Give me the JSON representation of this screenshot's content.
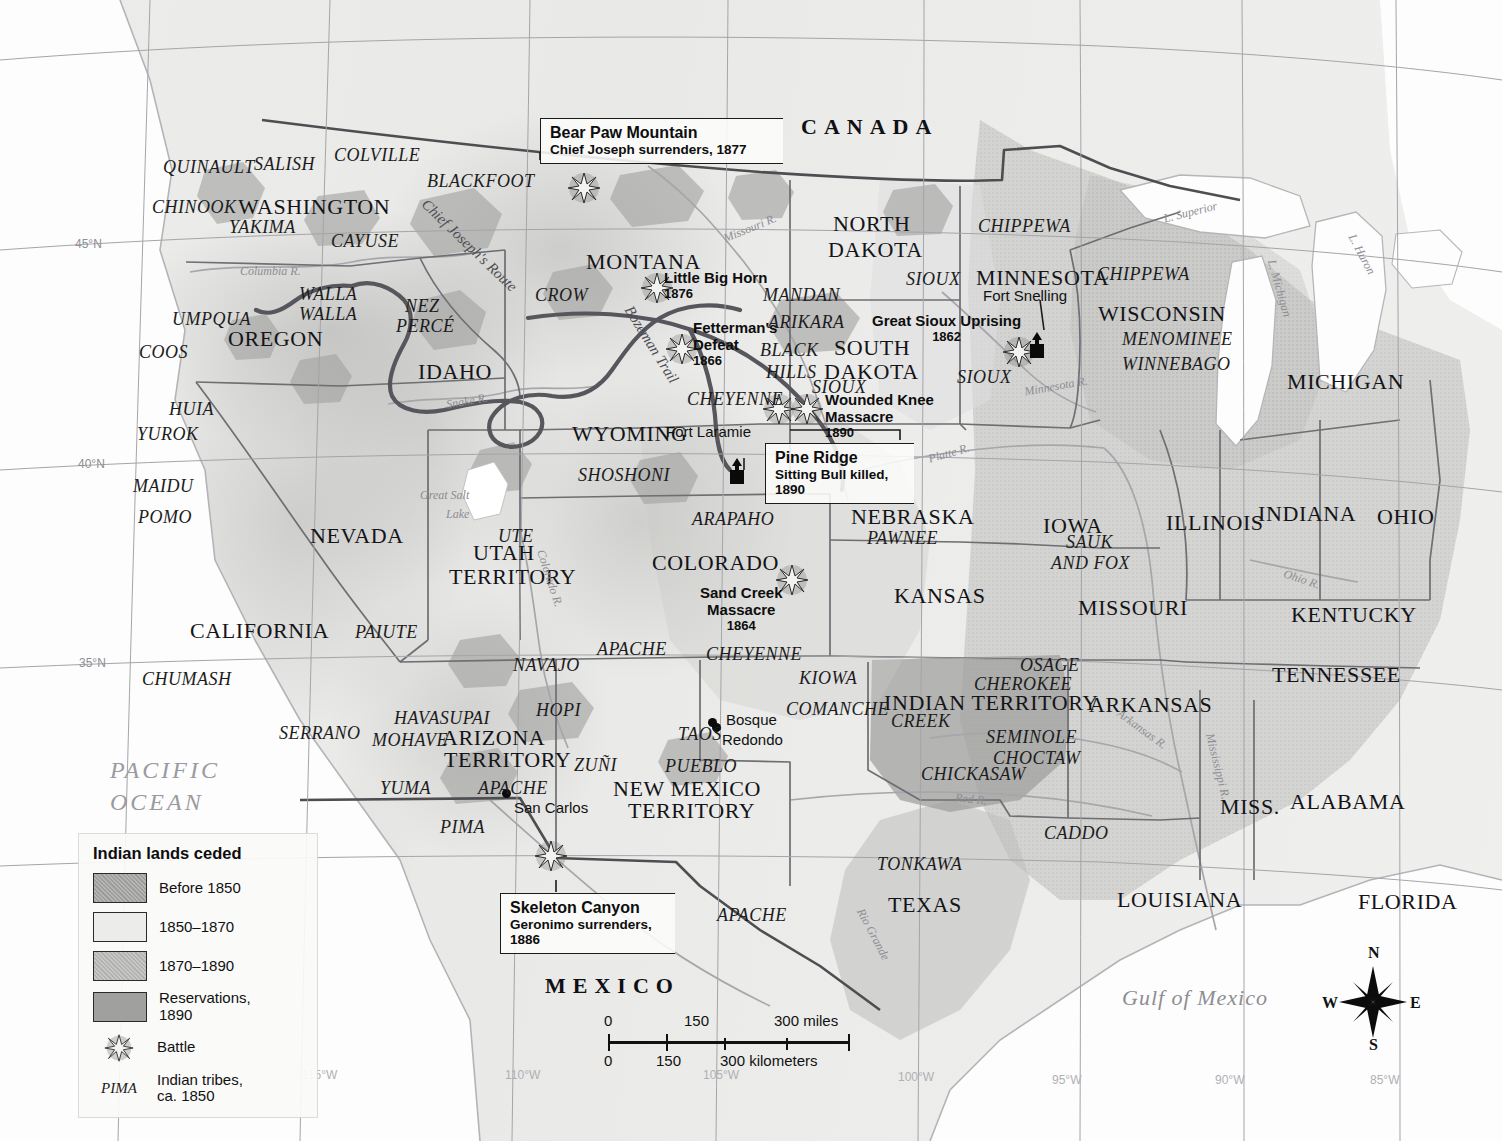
{
  "map": {
    "title_context": "Indian lands ceded and Indian wars of the American West",
    "countries": [
      {
        "name": "CANADA",
        "x": 801,
        "y": 115,
        "letter_spacing": "9px"
      },
      {
        "name": "MEXICO",
        "x": 545,
        "y": 974,
        "letter_spacing": "9px"
      }
    ],
    "ocean_labels": [
      {
        "name": "PACIFIC",
        "x": 110,
        "y": 754
      },
      {
        "name": "OCEAN",
        "x": 110,
        "y": 785
      },
      {
        "name": "Gulf of Mexico",
        "x": 1122,
        "y": 986
      }
    ],
    "states": [
      {
        "name": "WASHINGTON",
        "x": 238,
        "y": 195,
        "size": "big"
      },
      {
        "name": "OREGON",
        "x": 228,
        "y": 327,
        "size": "big"
      },
      {
        "name": "IDAHO",
        "x": 418,
        "y": 360,
        "size": "big"
      },
      {
        "name": "MONTANA",
        "x": 586,
        "y": 250,
        "size": "big"
      },
      {
        "name": "NORTH",
        "x": 833,
        "y": 212,
        "size": "big"
      },
      {
        "name": "DAKOTA",
        "x": 828,
        "y": 238,
        "size": "big"
      },
      {
        "name": "SOUTH",
        "x": 834,
        "y": 336,
        "size": "big"
      },
      {
        "name": "DAKOTA",
        "x": 824,
        "y": 360,
        "size": "big"
      },
      {
        "name": "MINNESOTA",
        "x": 976,
        "y": 266,
        "size": "big"
      },
      {
        "name": "WISCONSIN",
        "x": 1098,
        "y": 302,
        "size": "big"
      },
      {
        "name": "MICHIGAN",
        "x": 1287,
        "y": 370,
        "size": "big"
      },
      {
        "name": "WYOMING",
        "x": 572,
        "y": 422,
        "size": "big"
      },
      {
        "name": "NEVADA",
        "x": 310,
        "y": 524,
        "size": "big"
      },
      {
        "name": "UTAH",
        "x": 473,
        "y": 541,
        "size": "big"
      },
      {
        "name": "TERRITORY",
        "x": 449,
        "y": 565,
        "size": "big"
      },
      {
        "name": "COLORADO",
        "x": 652,
        "y": 551,
        "size": "big"
      },
      {
        "name": "NEBRASKA",
        "x": 851,
        "y": 505,
        "size": "big"
      },
      {
        "name": "IOWA",
        "x": 1043,
        "y": 514,
        "size": "big"
      },
      {
        "name": "ILLINOIS",
        "x": 1166,
        "y": 511,
        "size": "big"
      },
      {
        "name": "INDIANA",
        "x": 1258,
        "y": 502,
        "size": "big"
      },
      {
        "name": "OHIO",
        "x": 1377,
        "y": 505,
        "size": "big"
      },
      {
        "name": "KANSAS",
        "x": 894,
        "y": 584,
        "size": "big"
      },
      {
        "name": "MISSOURI",
        "x": 1078,
        "y": 596,
        "size": "big"
      },
      {
        "name": "KENTUCKY",
        "x": 1291,
        "y": 603,
        "size": "big"
      },
      {
        "name": "TENNESSEE",
        "x": 1272,
        "y": 663,
        "size": "big"
      },
      {
        "name": "CALIFORNIA",
        "x": 190,
        "y": 619,
        "size": "big"
      },
      {
        "name": "ARIZONA",
        "x": 442,
        "y": 726,
        "size": "big"
      },
      {
        "name": "TERRITORY",
        "x": 444,
        "y": 748,
        "size": "big"
      },
      {
        "name": "NEW MEXICO",
        "x": 613,
        "y": 777,
        "size": "big"
      },
      {
        "name": "TERRITORY",
        "x": 628,
        "y": 799,
        "size": "big"
      },
      {
        "name": "INDIAN TERRITORY",
        "x": 884,
        "y": 691,
        "size": "big"
      },
      {
        "name": "ARKANSAS",
        "x": 1089,
        "y": 693,
        "size": "big"
      },
      {
        "name": "MISS.",
        "x": 1220,
        "y": 795,
        "size": "big"
      },
      {
        "name": "ALABAMA",
        "x": 1290,
        "y": 790,
        "size": "big"
      },
      {
        "name": "FLORIDA",
        "x": 1358,
        "y": 890,
        "size": "big"
      },
      {
        "name": "LOUISIANA",
        "x": 1117,
        "y": 888,
        "size": "big"
      },
      {
        "name": "TEXAS",
        "x": 888,
        "y": 893,
        "size": "big"
      }
    ],
    "tribes": [
      {
        "name": "QUINAULT",
        "x": 163,
        "y": 158
      },
      {
        "name": "SALISH",
        "x": 254,
        "y": 155
      },
      {
        "name": "COLVILLE",
        "x": 334,
        "y": 146
      },
      {
        "name": "BLACKFOOT",
        "x": 427,
        "y": 172
      },
      {
        "name": "CHINOOK",
        "x": 152,
        "y": 198
      },
      {
        "name": "YAKIMA",
        "x": 229,
        "y": 218
      },
      {
        "name": "CAYUSE",
        "x": 331,
        "y": 232
      },
      {
        "name": "WALLA",
        "x": 299,
        "y": 285
      },
      {
        "name": "WALLA",
        "x": 299,
        "y": 305
      },
      {
        "name": "NEZ",
        "x": 405,
        "y": 297
      },
      {
        "name": "PERCÉ",
        "x": 396,
        "y": 317
      },
      {
        "name": "UMPQUA",
        "x": 172,
        "y": 310
      },
      {
        "name": "COOS",
        "x": 139,
        "y": 343
      },
      {
        "name": "HUIA",
        "x": 169,
        "y": 400
      },
      {
        "name": "YUROK",
        "x": 137,
        "y": 425
      },
      {
        "name": "MAIDU",
        "x": 133,
        "y": 477
      },
      {
        "name": "POMO",
        "x": 138,
        "y": 508
      },
      {
        "name": "CROW",
        "x": 535,
        "y": 286
      },
      {
        "name": "CHIPPEWA",
        "x": 978,
        "y": 217
      },
      {
        "name": "CHIPPEWA",
        "x": 1097,
        "y": 265
      },
      {
        "name": "SIOUX",
        "x": 906,
        "y": 270
      },
      {
        "name": "MANDAN",
        "x": 763,
        "y": 286
      },
      {
        "name": "ARIKARA",
        "x": 768,
        "y": 313
      },
      {
        "name": "SIOUX",
        "x": 957,
        "y": 368
      },
      {
        "name": "SIOUX",
        "x": 812,
        "y": 378
      },
      {
        "name": "MENOMINEE",
        "x": 1122,
        "y": 330
      },
      {
        "name": "WINNEBAGO",
        "x": 1122,
        "y": 355
      },
      {
        "name": "BLACK",
        "x": 760,
        "y": 341
      },
      {
        "name": "HILLS",
        "x": 766,
        "y": 363
      },
      {
        "name": "CHEYENNE",
        "x": 687,
        "y": 390
      },
      {
        "name": "SHOSHONI",
        "x": 578,
        "y": 466
      },
      {
        "name": "ARAPAHO",
        "x": 692,
        "y": 510
      },
      {
        "name": "PAWNEE",
        "x": 867,
        "y": 529
      },
      {
        "name": "SAUK",
        "x": 1066,
        "y": 533
      },
      {
        "name": "AND FOX",
        "x": 1051,
        "y": 554
      },
      {
        "name": "UTE",
        "x": 498,
        "y": 527
      },
      {
        "name": "PAIUTE",
        "x": 355,
        "y": 623
      },
      {
        "name": "CHUMASH",
        "x": 142,
        "y": 670
      },
      {
        "name": "SERRANO",
        "x": 279,
        "y": 724
      },
      {
        "name": "APACHE",
        "x": 597,
        "y": 640
      },
      {
        "name": "CHEYENNE",
        "x": 706,
        "y": 645
      },
      {
        "name": "KIOWA",
        "x": 799,
        "y": 669
      },
      {
        "name": "OSAGE",
        "x": 1020,
        "y": 656
      },
      {
        "name": "CHEROKEE",
        "x": 974,
        "y": 675
      },
      {
        "name": "COMANCHE",
        "x": 786,
        "y": 700
      },
      {
        "name": "CREEK",
        "x": 891,
        "y": 712
      },
      {
        "name": "SEMINOLE",
        "x": 986,
        "y": 728
      },
      {
        "name": "CHOCTAW",
        "x": 993,
        "y": 749
      },
      {
        "name": "CHICKASAW",
        "x": 921,
        "y": 765
      },
      {
        "name": "NAVAJO",
        "x": 513,
        "y": 656
      },
      {
        "name": "HAVASUPAI",
        "x": 394,
        "y": 709
      },
      {
        "name": "HOPI",
        "x": 536,
        "y": 701
      },
      {
        "name": "MOHAVE",
        "x": 372,
        "y": 731
      },
      {
        "name": "ZUNI_SP",
        "x": 574,
        "y": 756,
        "text": "ZUÑI"
      },
      {
        "name": "TAOS",
        "x": 678,
        "y": 725
      },
      {
        "name": "PUEBLO",
        "x": 665,
        "y": 757
      },
      {
        "name": "YUMA",
        "x": 380,
        "y": 779
      },
      {
        "name": "APACHE",
        "x": 478,
        "y": 779
      },
      {
        "name": "PIMA",
        "x": 440,
        "y": 818
      },
      {
        "name": "CADDO",
        "x": 1044,
        "y": 824
      },
      {
        "name": "TONKAWA",
        "x": 877,
        "y": 855
      },
      {
        "name": "APACHE",
        "x": 717,
        "y": 906
      }
    ],
    "waters": [
      {
        "name": "Columbia R.",
        "x": 240,
        "y": 265,
        "size": "sm",
        "rot": 0
      },
      {
        "name": "Missouri R.",
        "x": 722,
        "y": 222,
        "size": "sm",
        "rot": -22
      },
      {
        "name": "Snake R.",
        "x": 446,
        "y": 395,
        "size": "sm",
        "rot": -10
      },
      {
        "name": "Great Salt",
        "x": 420,
        "y": 489,
        "size": "sm",
        "rot": 0
      },
      {
        "name": "Lake",
        "x": 446,
        "y": 508,
        "size": "sm",
        "rot": 0
      },
      {
        "name": "Colorado R.",
        "x": 520,
        "y": 572,
        "size": "sm",
        "rot": 72
      },
      {
        "name": "Minnesota R.",
        "x": 1024,
        "y": 380,
        "size": "sm",
        "rot": -10
      },
      {
        "name": "Platte R.",
        "x": 928,
        "y": 447,
        "size": "sm",
        "rot": -16
      },
      {
        "name": "Ohio R.",
        "x": 1283,
        "y": 573,
        "size": "sm",
        "rot": 18
      },
      {
        "name": "Arkansas R.",
        "x": 1113,
        "y": 723,
        "size": "sm",
        "rot": 36
      },
      {
        "name": "Mississippi R.",
        "x": 1184,
        "y": 760,
        "size": "sm",
        "rot": 76
      },
      {
        "name": "Red R.",
        "x": 955,
        "y": 793,
        "size": "sm",
        "rot": 6
      },
      {
        "name": "Rio Grande",
        "x": 845,
        "y": 928,
        "size": "sm",
        "rot": 62
      },
      {
        "name": "L. Superior",
        "x": 1163,
        "y": 206,
        "size": "sm",
        "rot": -14
      },
      {
        "name": "L. Huron",
        "x": 1340,
        "y": 248,
        "size": "sm",
        "rot": 62
      },
      {
        "name": "L. Michigan",
        "x": 1250,
        "y": 282,
        "size": "sm",
        "rot": 74
      }
    ],
    "routes": [
      {
        "name": "Chief Joseph's Route",
        "x": 406,
        "y": 238,
        "rot": 44
      },
      {
        "name": "Bozeman Trail",
        "x": 607,
        "y": 337,
        "rot": 58
      }
    ],
    "sites": [
      {
        "name": "Fort Snelling",
        "label": "Fort Snelling",
        "x": 983,
        "y": 288,
        "marker": "fort",
        "mx": 1037,
        "my": 345
      },
      {
        "name": "Fort Laramie",
        "label": "Fort Laramie",
        "x": 666,
        "y": 424,
        "marker": "fort",
        "mx": 737,
        "my": 470
      },
      {
        "name": "Bosque",
        "label": "Bosque",
        "x": 725,
        "y": 713,
        "marker": "dot",
        "mx": 716,
        "my": 727
      },
      {
        "name": "Redondo",
        "label": "Redondo",
        "x": 722,
        "y": 733,
        "marker": "none"
      },
      {
        "name": "San Carlos",
        "label": "San Carlos",
        "x": 506,
        "y": 801,
        "marker": "dot",
        "mx": 506,
        "my": 793
      },
      {
        "name": "Taos",
        "label": "",
        "x": 0,
        "y": 0,
        "marker": "none"
      }
    ],
    "battles": [
      {
        "name": "Bear Paw Mountain",
        "x": 584,
        "y": 188
      },
      {
        "name": "Little Big Horn",
        "x": 657,
        "y": 287,
        "label": "Little Big Horn",
        "year": "1876",
        "lx": 663,
        "ly": 270
      },
      {
        "name": "Fetterman's Defeat",
        "x": 682,
        "y": 348,
        "label": "Fetterman's",
        "label2": "Defeat",
        "year": "1866",
        "lx": 692,
        "ly": 320
      },
      {
        "name": "Great Sioux Uprising",
        "x": 1019,
        "y": 352
      },
      {
        "name": "Wounded Knee Massacre A",
        "x": 779,
        "y": 409
      },
      {
        "name": "Wounded Knee Massacre B",
        "x": 806,
        "y": 409
      },
      {
        "name": "Sand Creek Massacre",
        "x": 792,
        "y": 580
      },
      {
        "name": "Skeleton Canyon",
        "x": 551,
        "y": 856
      }
    ],
    "battle_labels": [
      {
        "name": "little-big-horn",
        "title": "Little Big Horn",
        "year": "1876",
        "x": 664,
        "y": 270
      },
      {
        "name": "fettermans-defeat",
        "l1": "Fetterman's",
        "l2": "Defeat",
        "year": "1866",
        "x": 693,
        "y": 320
      },
      {
        "name": "wounded-knee",
        "l1": "Wounded Knee",
        "l2": "Massacre",
        "year": "1890",
        "x": 825,
        "y": 392
      },
      {
        "name": "great-sioux-uprising",
        "l1": "Great Sioux Uprising",
        "year": "1862",
        "x": 872,
        "y": 313
      },
      {
        "name": "sand-creek",
        "l1": "Sand Creek",
        "l2": "Massacre",
        "year": "1864",
        "x": 700,
        "y": 585
      }
    ],
    "callouts": [
      {
        "name": "bear-paw-mountain",
        "title": "Bear Paw Mountain",
        "sub": "Chief Joseph surrenders, 1877",
        "x": 540,
        "y": 118,
        "w": 228
      },
      {
        "name": "pine-ridge",
        "title": "Pine Ridge",
        "sub": "Sitting Bull killed,",
        "sub2": "1890",
        "x": 765,
        "y": 443,
        "w": 135
      },
      {
        "name": "skeleton-canyon",
        "title": "Skeleton Canyon",
        "sub": "Geronimo surrenders,",
        "sub2": "1886",
        "x": 500,
        "y": 893,
        "w": 160
      }
    ],
    "graticule": {
      "lat": [
        {
          "label": "45°N",
          "x": 75,
          "y": 238
        },
        {
          "label": "40°N",
          "x": 78,
          "y": 458
        },
        {
          "label": "35°N",
          "x": 79,
          "y": 657
        }
      ],
      "lon": [
        {
          "label": "115°W",
          "x": 302,
          "y": 1069
        },
        {
          "label": "110°W",
          "x": 505,
          "y": 1069
        },
        {
          "label": "105°W",
          "x": 703,
          "y": 1069
        },
        {
          "label": "100°W",
          "x": 898,
          "y": 1071
        },
        {
          "label": "95°W",
          "x": 1052,
          "y": 1074
        },
        {
          "label": "90°W",
          "x": 1215,
          "y": 1074
        },
        {
          "label": "85°W",
          "x": 1370,
          "y": 1074
        }
      ]
    }
  },
  "legend": {
    "title": "Indian lands ceded",
    "items": [
      {
        "label": "Before 1850",
        "color": "#a8a8a6",
        "pattern": "dots"
      },
      {
        "label": "1850–1870",
        "color": "#e8e8e6",
        "pattern": "plain"
      },
      {
        "label": "1870–1890",
        "color": "#b9b9b7",
        "pattern": "dots"
      },
      {
        "label": "Reservations,",
        "label2": "1890",
        "color": "#9a9a98",
        "pattern": "plain"
      },
      {
        "label": "Battle",
        "symbol": "battle"
      },
      {
        "label": "Indian tribes,",
        "label2": "ca. 1850",
        "symbol": "PIMA"
      }
    ]
  },
  "scale": {
    "miles": {
      "ticks": [
        "0",
        "150",
        "300 miles"
      ]
    },
    "kilometers": {
      "ticks": [
        "0",
        "150",
        "300 kilometers"
      ]
    }
  },
  "compass": {
    "n": "N",
    "e": "E",
    "s": "S",
    "w": "W"
  },
  "colors": {
    "ceded_before_1850": "#a8a8a6",
    "ceded_1850_1870": "#e8e8e6",
    "ceded_1870_1890": "#b9b9b7",
    "reservations_1890": "#9a9a98",
    "ocean": "#fdfdfd",
    "land": "#ececea",
    "border": "#4a4a4e",
    "route": "#55555a"
  }
}
